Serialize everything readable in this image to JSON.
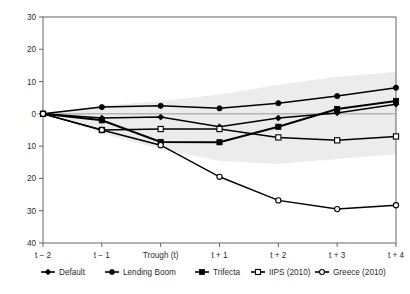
{
  "chart_data": {
    "type": "line",
    "title": "",
    "subtitle": "",
    "xlabel": "",
    "ylabel": "",
    "grid": false,
    "legend_position": "bottom",
    "x": [
      "t − 2",
      "t − 1",
      "Trough (t)",
      "t + 1",
      "t + 2",
      "t + 3",
      "t + 4"
    ],
    "y_tick_labels": [
      "30",
      "20",
      "10",
      "0",
      "10",
      "20",
      "30",
      "40"
    ],
    "y_tick_values": [
      30,
      20,
      10,
      0,
      -10,
      -20,
      -30,
      -40
    ],
    "ylim": [
      -40,
      30
    ],
    "note_axis": "Negative y tick labels are printed without a minus sign",
    "series": [
      {
        "name": "Default",
        "marker": "diamond-filled",
        "values": [
          0,
          -1.3,
          -1.0,
          -4.0,
          -1.3,
          0.3,
          3.0
        ]
      },
      {
        "name": "Lending Boom",
        "marker": "circle-filled",
        "values": [
          0,
          2.1,
          2.5,
          1.7,
          3.3,
          5.5,
          8.1
        ]
      },
      {
        "name": "Trifecta",
        "marker": "square-filled",
        "values": [
          0,
          -2.0,
          -8.7,
          -8.8,
          -4.0,
          1.5,
          4.0
        ]
      },
      {
        "name": "IIPS (2010)",
        "marker": "square-open",
        "values": [
          0,
          -5.0,
          -4.7,
          -4.7,
          -7.3,
          -8.2,
          -7.0
        ]
      },
      {
        "name": "Greece (2010)",
        "marker": "circle-open",
        "values": [
          0,
          -5.0,
          -9.7,
          -19.5,
          -26.8,
          -29.5,
          -28.3
        ]
      }
    ],
    "confidence_band": {
      "label": "shaded confidence region",
      "color": "#e9e9e9",
      "upper": [
        0,
        2.6,
        4.0,
        6.0,
        9.0,
        11.5,
        13.0
      ],
      "lower": [
        0,
        -6.0,
        -11.0,
        -14.5,
        -15.5,
        -14.0,
        -12.5
      ]
    }
  },
  "legend": {
    "items": [
      {
        "label": "Default",
        "marker": "diamond-filled"
      },
      {
        "label": "Lending Boom",
        "marker": "circle-filled"
      },
      {
        "label": "Trifecta",
        "marker": "square-filled"
      },
      {
        "label": "IIPS (2010)",
        "marker": "square-open"
      },
      {
        "label": "Greece (2010)",
        "marker": "circle-open"
      }
    ]
  }
}
